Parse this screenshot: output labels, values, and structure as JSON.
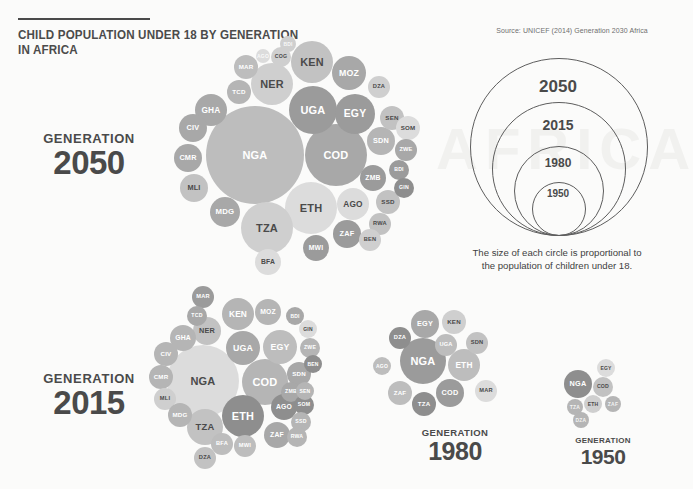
{
  "header": {
    "title": "CHILD POPULATION UNDER 18 BY GENERATION IN AFRICA",
    "source": "Source: UNICEF (2014) Generation 2030 Africa",
    "watermark": "AFRICA"
  },
  "legend": {
    "caption": "The size of each circle is proportional to the population of children under 18.",
    "rings": [
      {
        "label": "2050",
        "r": 88
      },
      {
        "label": "2015",
        "r": 66
      },
      {
        "label": "1980",
        "r": 44
      },
      {
        "label": "1950",
        "r": 26
      }
    ]
  },
  "generations": [
    {
      "id": "gen2050",
      "generation_label": "GENERATION",
      "year": "2050"
    },
    {
      "id": "gen2015",
      "generation_label": "GENERATION",
      "year": "2015"
    },
    {
      "id": "gen1980",
      "generation_label": "GENERATION",
      "year": "1980"
    },
    {
      "id": "gen1950",
      "generation_label": "GENERATION",
      "year": "1950"
    }
  ],
  "chart_data": {
    "type": "bubble",
    "title": "CHILD POPULATION UNDER 18 BY GENERATION IN AFRICA",
    "note": "Each circle's area is proportional to the number of children under 18 in that country; clusters are packed per generation year.",
    "legend_rings": [
      "2050",
      "2015",
      "1980",
      "1950"
    ],
    "clusters": [
      {
        "year": "2050",
        "bubbles": [
          {
            "code": "NGA",
            "cx": 255,
            "cy": 155,
            "r": 49
          },
          {
            "code": "COD",
            "cx": 336,
            "cy": 155,
            "r": 31
          },
          {
            "code": "ETH",
            "cx": 311,
            "cy": 208,
            "r": 26
          },
          {
            "code": "TZA",
            "cx": 267,
            "cy": 228,
            "r": 26
          },
          {
            "code": "UGA",
            "cx": 313,
            "cy": 110,
            "r": 24
          },
          {
            "code": "EGY",
            "cx": 355,
            "cy": 114,
            "r": 20
          },
          {
            "code": "KEN",
            "cx": 312,
            "cy": 62,
            "r": 21
          },
          {
            "code": "NER",
            "cx": 272,
            "cy": 84,
            "r": 21
          },
          {
            "code": "MOZ",
            "cx": 349,
            "cy": 73,
            "r": 17
          },
          {
            "code": "AGO",
            "cx": 353,
            "cy": 204,
            "r": 16
          },
          {
            "code": "ZAF",
            "cx": 347,
            "cy": 234,
            "r": 14
          },
          {
            "code": "GHA",
            "cx": 211,
            "cy": 110,
            "r": 16
          },
          {
            "code": "CIV",
            "cx": 193,
            "cy": 128,
            "r": 14
          },
          {
            "code": "CMR",
            "cx": 188,
            "cy": 158,
            "r": 14
          },
          {
            "code": "MLI",
            "cx": 194,
            "cy": 188,
            "r": 14
          },
          {
            "code": "MDG",
            "cx": 225,
            "cy": 212,
            "r": 15
          },
          {
            "code": "MWI",
            "cx": 316,
            "cy": 248,
            "r": 13
          },
          {
            "code": "BFA",
            "cx": 268,
            "cy": 262,
            "r": 13
          },
          {
            "code": "SDN",
            "cx": 381,
            "cy": 141,
            "r": 14
          },
          {
            "code": "ZMB",
            "cx": 373,
            "cy": 178,
            "r": 13
          },
          {
            "code": "SSD",
            "cx": 388,
            "cy": 202,
            "r": 12
          },
          {
            "code": "RWA",
            "cx": 380,
            "cy": 224,
            "r": 11
          },
          {
            "code": "BEN",
            "cx": 370,
            "cy": 240,
            "r": 11
          },
          {
            "code": "SEN",
            "cx": 392,
            "cy": 118,
            "r": 12
          },
          {
            "code": "SOM",
            "cx": 408,
            "cy": 128,
            "r": 12
          },
          {
            "code": "ZWE",
            "cx": 406,
            "cy": 150,
            "r": 11
          },
          {
            "code": "BDI",
            "cx": 399,
            "cy": 170,
            "r": 10
          },
          {
            "code": "GIN",
            "cx": 404,
            "cy": 188,
            "r": 10
          },
          {
            "code": "DZA",
            "cx": 379,
            "cy": 87,
            "r": 11
          },
          {
            "code": "MAR",
            "cx": 246,
            "cy": 67,
            "r": 12
          },
          {
            "code": "TCD",
            "cx": 239,
            "cy": 92,
            "r": 12
          },
          {
            "code": "COG",
            "cx": 281,
            "cy": 57,
            "r": 10
          },
          {
            "code": "AGO2",
            "cx": 263,
            "cy": 56,
            "r": 7
          },
          {
            "code": "BDI2",
            "cx": 288,
            "cy": 44,
            "r": 8
          }
        ]
      },
      {
        "year": "2015",
        "bubbles": [
          {
            "code": "NGA",
            "cx": 203,
            "cy": 381,
            "r": 36
          },
          {
            "code": "COD",
            "cx": 265,
            "cy": 382,
            "r": 23
          },
          {
            "code": "ETH",
            "cx": 243,
            "cy": 416,
            "r": 21
          },
          {
            "code": "TZA",
            "cx": 205,
            "cy": 427,
            "r": 18
          },
          {
            "code": "UGA",
            "cx": 243,
            "cy": 348,
            "r": 17
          },
          {
            "code": "EGY",
            "cx": 280,
            "cy": 347,
            "r": 17
          },
          {
            "code": "KEN",
            "cx": 238,
            "cy": 314,
            "r": 16
          },
          {
            "code": "NER",
            "cx": 207,
            "cy": 331,
            "r": 14
          },
          {
            "code": "MOZ",
            "cx": 268,
            "cy": 312,
            "r": 13
          },
          {
            "code": "AGO",
            "cx": 284,
            "cy": 407,
            "r": 13
          },
          {
            "code": "ZAF",
            "cx": 277,
            "cy": 435,
            "r": 13
          },
          {
            "code": "GHA",
            "cx": 183,
            "cy": 338,
            "r": 13
          },
          {
            "code": "CIV",
            "cx": 166,
            "cy": 354,
            "r": 12
          },
          {
            "code": "CMR",
            "cx": 161,
            "cy": 377,
            "r": 12
          },
          {
            "code": "MLI",
            "cx": 165,
            "cy": 399,
            "r": 11
          },
          {
            "code": "MDG",
            "cx": 180,
            "cy": 415,
            "r": 12
          },
          {
            "code": "MWI",
            "cx": 245,
            "cy": 446,
            "r": 11
          },
          {
            "code": "BFA",
            "cx": 222,
            "cy": 444,
            "r": 11
          },
          {
            "code": "DZA",
            "cx": 205,
            "cy": 458,
            "r": 11
          },
          {
            "code": "SDN",
            "cx": 299,
            "cy": 374,
            "r": 12
          },
          {
            "code": "ZMB",
            "cx": 291,
            "cy": 392,
            "r": 10
          },
          {
            "code": "SOM",
            "cx": 304,
            "cy": 405,
            "r": 10
          },
          {
            "code": "SSD",
            "cx": 301,
            "cy": 422,
            "r": 10
          },
          {
            "code": "RWA",
            "cx": 297,
            "cy": 437,
            "r": 10
          },
          {
            "code": "SEN",
            "cx": 305,
            "cy": 391,
            "r": 9
          },
          {
            "code": "ZWE",
            "cx": 310,
            "cy": 348,
            "r": 10
          },
          {
            "code": "GIN",
            "cx": 308,
            "cy": 329,
            "r": 9
          },
          {
            "code": "BDI",
            "cx": 295,
            "cy": 316,
            "r": 9
          },
          {
            "code": "BEN",
            "cx": 313,
            "cy": 364,
            "r": 9
          },
          {
            "code": "MAR",
            "cx": 203,
            "cy": 297,
            "r": 11
          },
          {
            "code": "TCD",
            "cx": 197,
            "cy": 316,
            "r": 10
          }
        ]
      },
      {
        "year": "1980",
        "bubbles": [
          {
            "code": "NGA",
            "cx": 423,
            "cy": 361,
            "r": 23
          },
          {
            "code": "ETH",
            "cx": 464,
            "cy": 365,
            "r": 16
          },
          {
            "code": "COD",
            "cx": 450,
            "cy": 393,
            "r": 14
          },
          {
            "code": "EGY",
            "cx": 425,
            "cy": 324,
            "r": 14
          },
          {
            "code": "ZAF",
            "cx": 400,
            "cy": 393,
            "r": 12
          },
          {
            "code": "TZA",
            "cx": 424,
            "cy": 404,
            "r": 12
          },
          {
            "code": "KEN",
            "cx": 454,
            "cy": 322,
            "r": 12
          },
          {
            "code": "UGA",
            "cx": 446,
            "cy": 345,
            "r": 11
          },
          {
            "code": "SDN",
            "cx": 477,
            "cy": 343,
            "r": 11
          },
          {
            "code": "DZA",
            "cx": 400,
            "cy": 338,
            "r": 11
          },
          {
            "code": "MAR",
            "cx": 486,
            "cy": 391,
            "r": 11
          },
          {
            "code": "AGO",
            "cx": 382,
            "cy": 366,
            "r": 9
          }
        ]
      },
      {
        "year": "1950",
        "bubbles": [
          {
            "code": "NGA",
            "cx": 578,
            "cy": 384,
            "r": 14
          },
          {
            "code": "COD",
            "cx": 603,
            "cy": 387,
            "r": 10
          },
          {
            "code": "ETH",
            "cx": 593,
            "cy": 404,
            "r": 9
          },
          {
            "code": "EGY",
            "cx": 606,
            "cy": 368,
            "r": 9
          },
          {
            "code": "TZA",
            "cx": 575,
            "cy": 407,
            "r": 8
          },
          {
            "code": "ZAF",
            "cx": 613,
            "cy": 404,
            "r": 8
          },
          {
            "code": "DZA",
            "cx": 581,
            "cy": 420,
            "r": 8
          }
        ]
      }
    ]
  }
}
